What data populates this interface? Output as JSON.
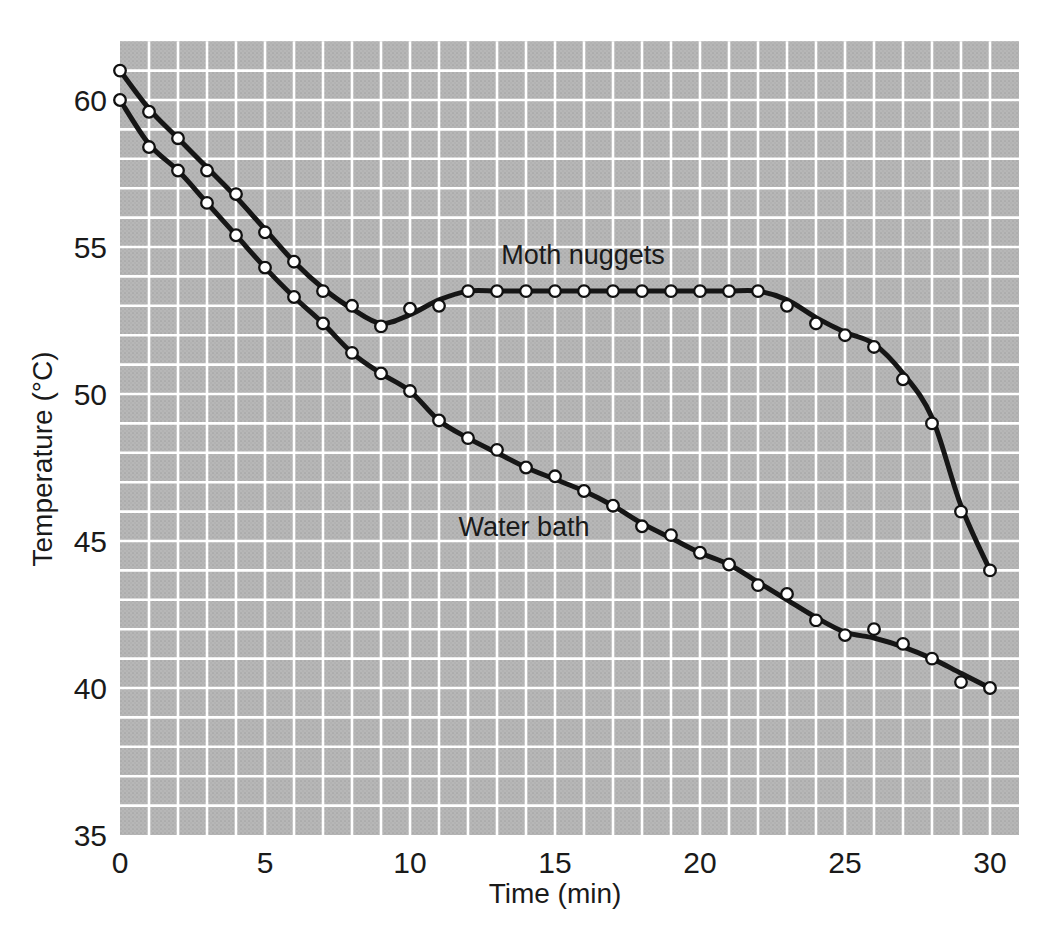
{
  "chart_data": {
    "type": "line",
    "title": "",
    "xlabel": "Time (min)",
    "ylabel": "Temperature (°C)",
    "x_ticks": [
      0,
      5,
      10,
      15,
      20,
      25,
      30
    ],
    "y_ticks": [
      35,
      40,
      45,
      50,
      55,
      60
    ],
    "xlim": [
      0,
      31
    ],
    "ylim": [
      35,
      62
    ],
    "grid": {
      "on": true,
      "cell_x_min": 1,
      "cell_y_degC": 1,
      "line_color": "#ffffff",
      "bg_color": "#b3b3b3"
    },
    "legend_position": "inline-curve-labels",
    "marker": "open-circle",
    "line_color": "#161616",
    "x": [
      0,
      1,
      2,
      3,
      4,
      5,
      6,
      7,
      8,
      9,
      10,
      11,
      12,
      13,
      14,
      15,
      16,
      17,
      18,
      19,
      20,
      21,
      22,
      23,
      24,
      25,
      26,
      27,
      28,
      29,
      30
    ],
    "series": [
      {
        "name": "Moth nuggets",
        "values": [
          61.0,
          59.6,
          58.7,
          57.6,
          56.8,
          55.5,
          54.5,
          53.5,
          53.0,
          52.3,
          52.9,
          53.0,
          53.5,
          53.5,
          53.5,
          53.5,
          53.5,
          53.5,
          53.5,
          53.5,
          53.5,
          53.5,
          53.5,
          53.0,
          52.4,
          52.0,
          51.6,
          50.5,
          49.0,
          46.0,
          44.0
        ],
        "trend": [
          61.0,
          59.7,
          58.7,
          57.7,
          56.7,
          55.6,
          54.5,
          53.6,
          52.9,
          52.4,
          52.7,
          53.2,
          53.5,
          53.5,
          53.5,
          53.5,
          53.5,
          53.5,
          53.5,
          53.5,
          53.5,
          53.5,
          53.5,
          53.2,
          52.6,
          52.1,
          51.7,
          50.7,
          49.2,
          46.2,
          44.0
        ]
      },
      {
        "name": "Water bath",
        "values": [
          60.0,
          58.4,
          57.6,
          56.5,
          55.4,
          54.3,
          53.3,
          52.4,
          51.4,
          50.7,
          50.1,
          49.1,
          48.5,
          48.1,
          47.5,
          47.2,
          46.7,
          46.2,
          45.5,
          45.2,
          44.6,
          44.2,
          43.5,
          43.2,
          42.3,
          41.8,
          42.0,
          41.5,
          41.0,
          40.2,
          40.0
        ],
        "trend": [
          60.0,
          58.5,
          57.6,
          56.5,
          55.4,
          54.3,
          53.3,
          52.4,
          51.4,
          50.7,
          50.1,
          49.1,
          48.5,
          48.0,
          47.5,
          47.1,
          46.7,
          46.2,
          45.6,
          45.1,
          44.6,
          44.2,
          43.6,
          43.0,
          42.4,
          41.9,
          41.7,
          41.4,
          41.0,
          40.5,
          40.0
        ]
      }
    ]
  }
}
